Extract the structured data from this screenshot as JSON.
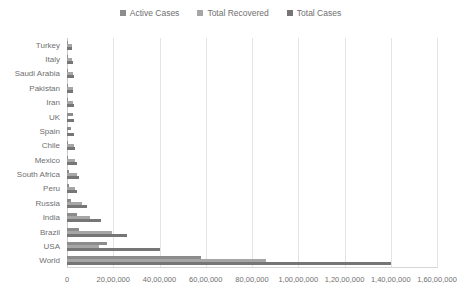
{
  "chart_data": {
    "type": "bar",
    "orientation": "horizontal",
    "title": "",
    "subtitle": "",
    "xlabel": "",
    "ylabel": "",
    "grid": true,
    "legend_position": "top-center",
    "xlim": [
      0,
      16000000
    ],
    "xticks": [
      0,
      2000000,
      4000000,
      6000000,
      8000000,
      10000000,
      12000000,
      14000000,
      16000000
    ],
    "xtick_labels": [
      "0",
      "20,00,000",
      "40,00,000",
      "60,00,000",
      "80,00,000",
      "1,00,00,000",
      "1,20,00,000",
      "1,40,00,000",
      "1,60,00,000"
    ],
    "categories": [
      "Turkey",
      "Italy",
      "Saudi Arabia",
      "Pakistan",
      "Iran",
      "UK",
      "Spain",
      "Chile",
      "Mexico",
      "South Africa",
      "Peru",
      "Russia",
      "India",
      "Brazil",
      "USA",
      "World"
    ],
    "series": [
      {
        "name": "Active Cases",
        "color": "#8c8c8c",
        "values": [
          11000,
          13000,
          40000,
          8000,
          38000,
          250000,
          180000,
          20000,
          60000,
          70000,
          90000,
          180000,
          440000,
          530000,
          1730000,
          5800000
        ]
      },
      {
        "name": "Total Recovered",
        "color": "#a6a6a6",
        "values": [
          210000,
          200000,
          240000,
          250000,
          250000,
          2000,
          2000,
          320000,
          330000,
          430000,
          330000,
          660000,
          990000,
          1960000,
          1400000,
          8600000
        ]
      },
      {
        "name": "Total Cases",
        "color": "#767676",
        "values": [
          228000,
          248000,
          290000,
          280000,
          300000,
          300000,
          320000,
          350000,
          430000,
          520000,
          430000,
          860000,
          1480000,
          2600000,
          4000000,
          14000000
        ]
      }
    ]
  },
  "legend": {
    "items": [
      {
        "label": "Active Cases",
        "color": "#8c8c8c"
      },
      {
        "label": "Total Recovered",
        "color": "#a6a6a6"
      },
      {
        "label": "Total Cases",
        "color": "#767676"
      }
    ]
  }
}
